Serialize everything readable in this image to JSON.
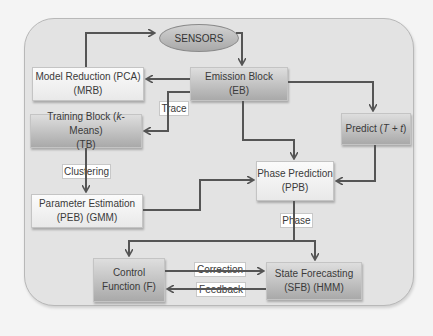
{
  "diagram": {
    "sensors": "SENSORS",
    "nodes": {
      "mrb": {
        "line1": "Model Reduction (PCA)",
        "line2": "(MRB)"
      },
      "eb": {
        "line1": "Emission Block",
        "line2": "(EB)"
      },
      "tb": {
        "line1a": "Training Block (",
        "line1k": "k",
        "line1b": "-Means)",
        "line2": "(TB)"
      },
      "predict": {
        "pre": "Predict (",
        "expr": "T + t",
        "post": ")"
      },
      "peb": {
        "line1": "Parameter Estimation",
        "line2": "(PEB) (GMM)"
      },
      "ppb": {
        "line1": "Phase Prediction",
        "line2": "(PPB)"
      },
      "cf": {
        "line1": "Control",
        "line2": "Function (F)"
      },
      "sfb": {
        "line1": "State Forecasting",
        "line2": "(SFB) (HMM)"
      }
    },
    "edge_labels": {
      "trace": "Trace",
      "clustering": "Clustering",
      "phase": "Phase",
      "correction": "Correction",
      "feedback": "Feedback"
    },
    "colors": {
      "line": "#555555",
      "panel": "#e3e3e3",
      "box_light": "#f4f4f4",
      "box_dark": "#b8b8b8"
    }
  }
}
